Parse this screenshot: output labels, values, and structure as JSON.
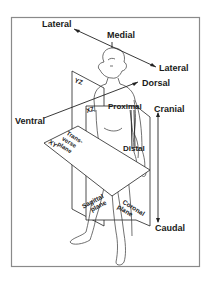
{
  "figure": {
    "frame_color": "#8a8a8a",
    "ink_color": "#1a1a1a"
  },
  "directions": {
    "lateral_left": "Lateral",
    "medial": "Medial",
    "lateral_right": "Lateral",
    "dorsal": "Dorsal",
    "ventral": "Ventral",
    "cranial": "Cranial",
    "caudal": "Caudal",
    "proximal": "Proximal",
    "distal": "Distal"
  },
  "planes": {
    "yz": "YZ",
    "xz": "XZ",
    "xy": "XY",
    "transverse_line1": "Trans-",
    "transverse_line2": "verse",
    "transverse_line3": "plane",
    "sagittal_line1": "Sagittal",
    "sagittal_line2": "plane",
    "coronal_line1": "Coronal",
    "coronal_line2": "plane"
  }
}
